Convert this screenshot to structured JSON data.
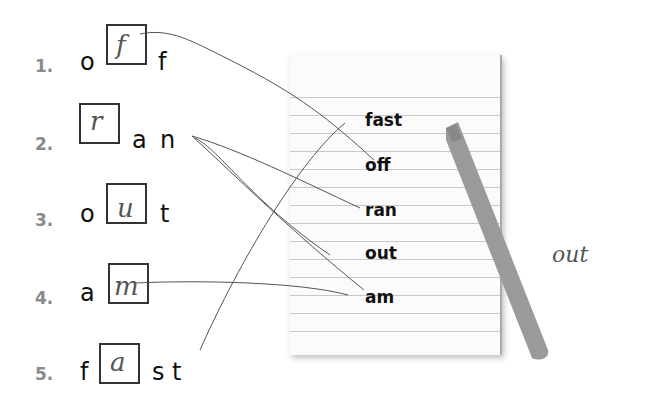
{
  "worksheet": {
    "rows": [
      {
        "number": "1.",
        "letters_before": [
          "o"
        ],
        "filled_letter": "f",
        "letters_after": [
          "f"
        ]
      },
      {
        "number": "2.",
        "letters_before": [],
        "filled_letter": "r",
        "letters_after": [
          "a",
          "n"
        ]
      },
      {
        "number": "3.",
        "letters_before": [
          "o"
        ],
        "filled_letter": "u",
        "letters_after": [
          "t"
        ]
      },
      {
        "number": "4.",
        "letters_before": [
          "a"
        ],
        "filled_letter": "m",
        "letters_after": []
      },
      {
        "number": "5.",
        "letters_before": [
          "f"
        ],
        "filled_letter": "a",
        "letters_after": [
          "s",
          "t"
        ]
      }
    ],
    "notepad_words": [
      "fast",
      "off",
      "ran",
      "out",
      "am"
    ],
    "handwritten_note": "out",
    "colors": {
      "number_gray": "#8a8a8a",
      "marker_gray": "#9a9a9a",
      "pencil_line": "#555555",
      "pad_line": "#c8c8c8"
    }
  }
}
